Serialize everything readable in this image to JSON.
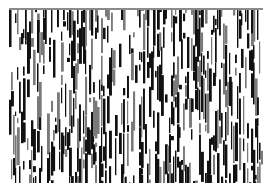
{
  "image": {
    "description": "Black and white noise texture with vertical streaks",
    "frame": {
      "x": 9,
      "y": 8,
      "width": 254,
      "height": 175
    },
    "colors": {
      "background": "#ffffff",
      "ink": "#111111",
      "mid": "#7a7a7a",
      "border": "#8a8a8a"
    },
    "pattern": {
      "columns": 127,
      "seed": 7,
      "density": 0.48
    }
  }
}
